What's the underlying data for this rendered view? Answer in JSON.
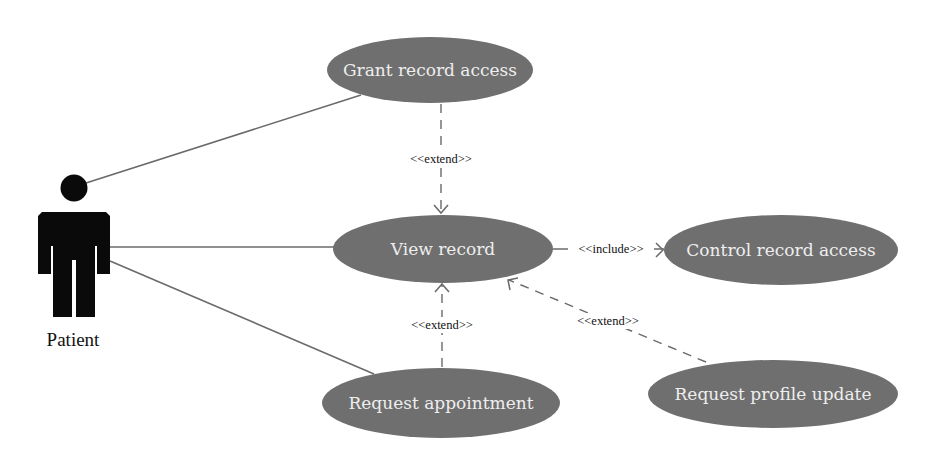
{
  "diagram": {
    "type": "uml-use-case",
    "actor": {
      "label": "Patient"
    },
    "use_cases": [
      {
        "id": "grant",
        "label": "Grant record access"
      },
      {
        "id": "view",
        "label": "View record"
      },
      {
        "id": "control",
        "label": "Control record access"
      },
      {
        "id": "appointment",
        "label": "Request appointment"
      },
      {
        "id": "profile",
        "label": "Request profile update"
      }
    ],
    "relations": [
      {
        "from": "Patient",
        "to": "grant",
        "kind": "association"
      },
      {
        "from": "Patient",
        "to": "view",
        "kind": "association"
      },
      {
        "from": "Patient",
        "to": "appointment",
        "kind": "association"
      },
      {
        "from": "grant",
        "to": "view",
        "kind": "dependency",
        "label": "<<extend>>"
      },
      {
        "from": "view",
        "to": "control",
        "kind": "dependency",
        "label": "<<include>>"
      },
      {
        "from": "appointment",
        "to": "view",
        "kind": "dependency",
        "label": "<<extend>>"
      },
      {
        "from": "profile",
        "to": "view",
        "kind": "dependency",
        "label": "<<extend>>"
      }
    ]
  },
  "colors": {
    "use_case_fill": "#6f6f6f",
    "use_case_text": "#eeeeee",
    "line": "#6a6a6a",
    "actor": "#0a0a0a"
  }
}
